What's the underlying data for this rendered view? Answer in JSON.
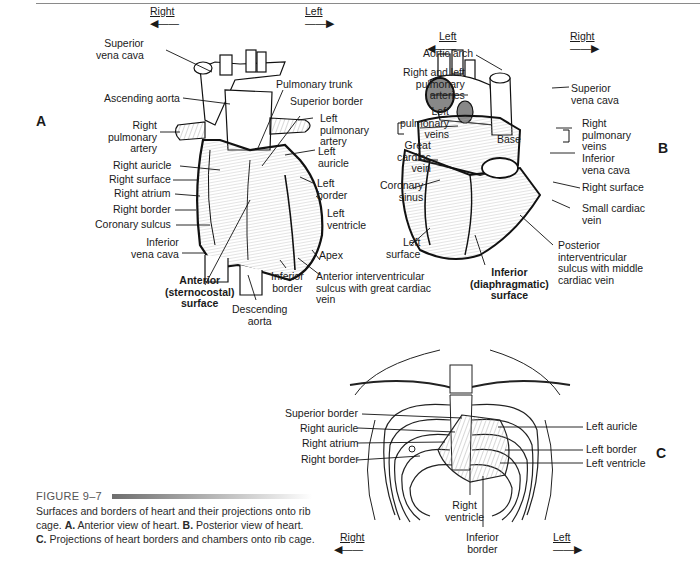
{
  "figure": {
    "number": "FIGURE 9–7",
    "caption_parts": [
      {
        "text": "Surfaces and borders of heart and their projections onto rib cage. ",
        "bold": false
      },
      {
        "text": "A.",
        "bold": true
      },
      {
        "text": " Anterior view of heart. ",
        "bold": false
      },
      {
        "text": "B.",
        "bold": true
      },
      {
        "text": " Posterior view of heart. ",
        "bold": false
      },
      {
        "text": "C.",
        "bold": true
      },
      {
        "text": " Projections of heart borders and chambers onto rib cage.",
        "bold": false
      }
    ]
  },
  "panel_a": {
    "letter": "A",
    "dir_right": "Right",
    "dir_left": "Left",
    "labels": {
      "superior_vena_cava": "Superior\nvena cava",
      "ascending_aorta": "Ascending aorta",
      "right_pulmonary_artery": "Right\npulmonary\nartery",
      "right_auricle": "Right auricle",
      "right_surface": "Right surface",
      "right_atrium": "Right atrium",
      "right_border": "Right border",
      "coronary_sulcus": "Coronary sulcus",
      "inferior_vena_cava": "Inferior\nvena cava",
      "anterior_surface": "Anterior\n(sternocostal)\nsurface",
      "descending_aorta": "Descending\naorta",
      "inferior_border": "Inferior\nborder",
      "anterior_iv_sulcus": "Anterior interventricular\nsulcus with great cardiac\nvein",
      "apex": "Apex",
      "left_ventricle": "Left\nventricle",
      "left_border": "Left\nborder",
      "left_auricle": "Left\nauricle",
      "left_pulmonary_artery": "Left\npulmonary\nartery",
      "superior_border": "Superior border",
      "pulmonary_trunk": "Pulmonary trunk"
    }
  },
  "panel_b": {
    "letter": "B",
    "dir_left": "Left",
    "dir_right": "Right",
    "labels": {
      "aortic_arch": "Aortic arch",
      "pulmonary_arteries": "Right and left\npulmonary\narteries",
      "left_pulmonary_veins": "Left\npulmonary\nveins",
      "great_cardiac_vein": "Great\ncardiac\nvein",
      "coronary_sinus": "Coronary\nsinus",
      "left_surface": "Left\nsurface",
      "inferior_surface": "Inferior\n(diaphragmatic)\nsurface",
      "posterior_iv_sulcus": "Posterior\ninterventricular\nsulcus with middle\ncardiac vein",
      "small_cardiac_vein": "Small cardiac\nvein",
      "right_surface": "Right surface",
      "inferior_vena_cava": "Inferior\nvena cava",
      "right_pulmonary_veins": "Right\npulmonary\nveins",
      "superior_vena_cava": "Superior\nvena cava",
      "base": "Base"
    }
  },
  "panel_c": {
    "letter": "C",
    "dir_right": "Right",
    "dir_left": "Left",
    "labels": {
      "superior_border": "Superior border",
      "right_auricle": "Right auricle",
      "right_atrium": "Right atrium",
      "right_border": "Right border",
      "right_ventricle": "Right\nventricle",
      "inferior_border": "Inferior\nborder",
      "left_auricle": "Left auricle",
      "left_border": "Left border",
      "left_ventricle": "Left ventricle"
    }
  }
}
